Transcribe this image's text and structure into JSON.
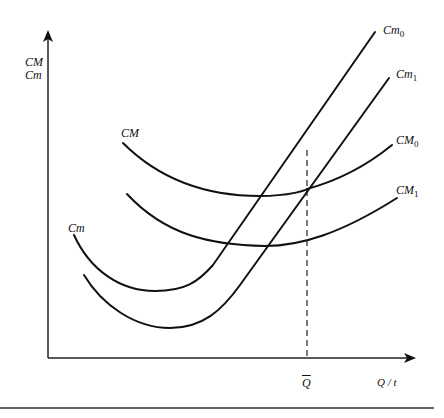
{
  "diagram": {
    "type": "cost-curves",
    "y_axis_label_line1": "CM",
    "y_axis_label_line2": "Cm",
    "x_axis_label": "Q / t",
    "q_bar_label": "Q",
    "curves": {
      "cm0": {
        "label": "Cm",
        "sub": "0"
      },
      "cm1": {
        "label": "Cm",
        "sub": "1"
      },
      "CM0": {
        "label": "CM",
        "sub": "0"
      },
      "CM1": {
        "label": "CM",
        "sub": "1"
      },
      "CM_upper_tag": {
        "label": "CM"
      },
      "cm_lower_tag": {
        "label": "Cm"
      }
    }
  }
}
